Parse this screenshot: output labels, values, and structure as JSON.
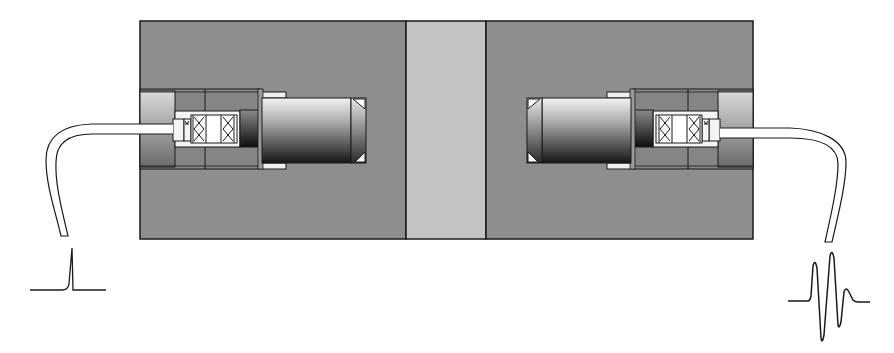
{
  "diagram": {
    "colors": {
      "block": "#8e8e8e",
      "specimen_strip": "#c4c4c4",
      "stroke": "#1a1a1a",
      "cable_fill": "#ffffff",
      "insert_light": "#d6d6d6"
    },
    "components": [
      {
        "id": "left-block",
        "label": "left coupling block"
      },
      {
        "id": "specimen",
        "label": "specimen strip"
      },
      {
        "id": "right-block",
        "label": "right coupling block"
      },
      {
        "id": "transmitter",
        "label": "transmitting transducer"
      },
      {
        "id": "receiver",
        "label": "receiving transducer"
      },
      {
        "id": "left-cable",
        "label": "transmitter cable"
      },
      {
        "id": "right-cable",
        "label": "receiver cable"
      }
    ],
    "signals": [
      {
        "id": "input-pulse",
        "label": "excitation pulse",
        "shape": "single spike"
      },
      {
        "id": "output-wave",
        "label": "received waveform",
        "shape": "oscillating burst"
      }
    ]
  }
}
